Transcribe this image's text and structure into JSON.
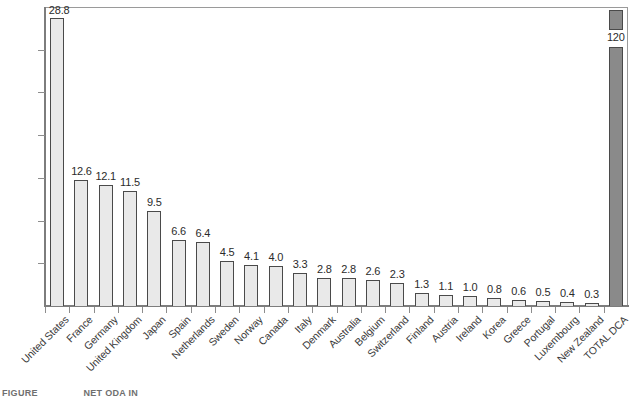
{
  "chart_data": {
    "type": "bar",
    "title": "",
    "subtitle": "",
    "xlabel": "",
    "ylabel": "",
    "grid": false,
    "legend": "none",
    "orientation": "vertical",
    "ylim": [
      0,
      30
    ],
    "axis_break": true,
    "axis_break_note": "TOTAL DCA bar is truncated by an axis break; a detached cap segment is drawn above the gap containing its value label.",
    "categories": [
      "United States",
      "France",
      "Germany",
      "United Kingdom",
      "Japan",
      "Spain",
      "Netherlands",
      "Sweden",
      "Norway",
      "Canada",
      "Italy",
      "Denmark",
      "Australia",
      "Belgium",
      "Switzerland",
      "Finland",
      "Austria",
      "Ireland",
      "Korea",
      "Greece",
      "Portugal",
      "Luxembourg",
      "New Zealand",
      "TOTAL DCA"
    ],
    "values": [
      28.8,
      12.6,
      12.1,
      11.5,
      9.5,
      6.6,
      6.4,
      4.5,
      4.1,
      4.0,
      3.3,
      2.8,
      2.8,
      2.6,
      2.3,
      1.3,
      1.1,
      1.0,
      0.8,
      0.6,
      0.5,
      0.4,
      0.3,
      120
    ],
    "value_labels": [
      "28.8",
      "12.6",
      "12.1",
      "11.5",
      "9.5",
      "6.6",
      "6.4",
      "4.5",
      "4.1",
      "4.0",
      "3.3",
      "2.8",
      "2.8",
      "2.6",
      "2.3",
      "1.3",
      "1.1",
      "1.0",
      "0.8",
      "0.6",
      "0.5",
      "0.4",
      "0.3",
      "120"
    ],
    "series": [
      {
        "name": "Value",
        "values": [
          28.8,
          12.6,
          12.1,
          11.5,
          9.5,
          6.6,
          6.4,
          4.5,
          4.1,
          4.0,
          3.3,
          2.8,
          2.8,
          2.6,
          2.3,
          1.3,
          1.1,
          1.0,
          0.8,
          0.6,
          0.5,
          0.4,
          0.3,
          120
        ]
      }
    ],
    "colors": {
      "bar_fill": "#e9e9e9",
      "bar_border": "#4a4a4a",
      "total_fill": "#8a8a8a",
      "frame": "#9a9a9a",
      "axis": "#7d7d7d",
      "text": "#2b2b2b"
    },
    "y_tick_count": 6,
    "y_ticks_labeled": false
  },
  "caption": {
    "left": "FIGURE",
    "right": "NET ODA IN"
  }
}
